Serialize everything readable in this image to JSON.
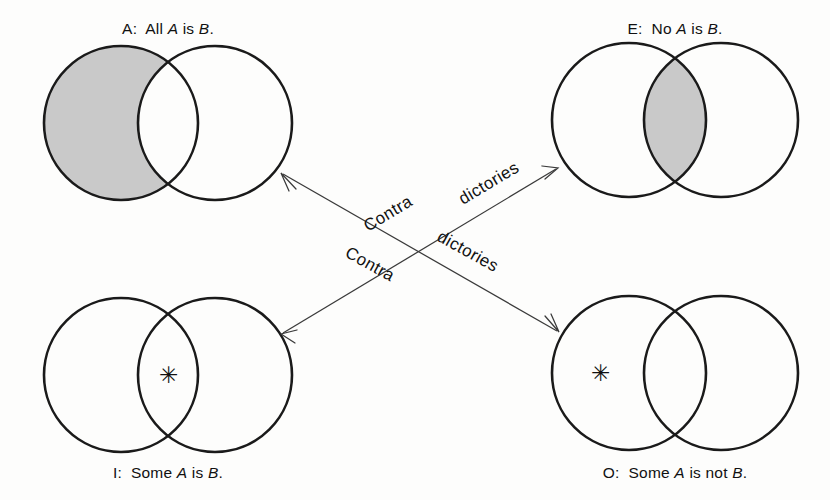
{
  "figure": {
    "background_color": "#fdfdfc",
    "stroke_color": "#1a1a1a",
    "shade_color": "#c9c9c9",
    "arrow_color": "#3a3a3a"
  },
  "diagrams": [
    {
      "id": "A",
      "position": "top-left",
      "caption_prefix": "A:",
      "caption_part1": "All",
      "caption_var1": "A",
      "caption_part2": "is",
      "caption_var2": "B",
      "caption_end": ".",
      "caption_full": "A:  All A is B.",
      "shading": "left-circle-only",
      "shading_description": "The portion of A outside B is shaded.",
      "has_star": false,
      "star_region": ""
    },
    {
      "id": "E",
      "position": "top-right",
      "caption_prefix": "E:",
      "caption_part1": "No",
      "caption_var1": "A",
      "caption_part2": "is",
      "caption_var2": "B",
      "caption_end": ".",
      "caption_full": "E:  No A is B.",
      "shading": "intersection",
      "shading_description": "The overlap of A and B is shaded.",
      "has_star": false,
      "star_region": ""
    },
    {
      "id": "I",
      "position": "bottom-left",
      "caption_prefix": "I:",
      "caption_part1": "Some",
      "caption_var1": "A",
      "caption_part2": "is",
      "caption_var2": "B",
      "caption_end": ".",
      "caption_full": "I:  Some A is B.",
      "shading": "none",
      "shading_description": "No shading.",
      "has_star": true,
      "star_region": "intersection",
      "star_glyph": "✳"
    },
    {
      "id": "O",
      "position": "bottom-right",
      "caption_prefix": "O:",
      "caption_part1": "Some",
      "caption_var1": "A",
      "caption_part2": "is not",
      "caption_var2": "B",
      "caption_end": ".",
      "caption_full": "O:  Some A is not B.",
      "shading": "none",
      "shading_description": "No shading.",
      "has_star": true,
      "star_region": "left-circle-only",
      "star_glyph": "✳"
    }
  ],
  "relations": [
    {
      "id": "a-o",
      "label_word1": "Contra",
      "label_word2": "dictories",
      "label_full": "Contra dictories",
      "from": "A",
      "to": "O",
      "direction": "double"
    },
    {
      "id": "e-i",
      "label_word1": "Contra",
      "label_word2": "dictories",
      "label_full": "Contra dictories",
      "from": "E",
      "to": "I",
      "direction": "double"
    }
  ]
}
